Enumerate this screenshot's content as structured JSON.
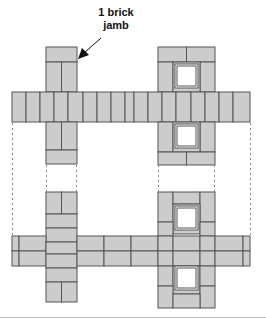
{
  "annotation": {
    "line1": "1 brick",
    "line2": "jamb"
  },
  "colors": {
    "brick_fill": "#cccccc",
    "brick_stroke": "#555555",
    "window_fill": "#ffffff",
    "dashed_line": "#888888",
    "arrow": "#111111"
  }
}
